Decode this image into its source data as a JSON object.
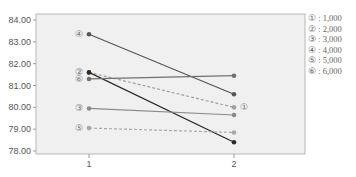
{
  "chart_data": {
    "type": "line",
    "title": "",
    "xlabel": "",
    "ylabel": "",
    "categories": [
      "1",
      "2"
    ],
    "ylim": [
      77.8,
      84.3
    ],
    "yticks": [
      "84.00",
      "83.00",
      "82.00",
      "81.00",
      "80.00",
      "79.00",
      "78.00"
    ],
    "ytick_values": [
      84,
      83,
      82,
      81,
      80,
      79,
      78
    ],
    "grid": false,
    "legend_position": "right",
    "series": [
      {
        "marker": "①",
        "name": "1,000",
        "values": [
          81.6,
          80.0
        ],
        "dashed": true,
        "color": "#a0a0a0",
        "label_side": "end"
      },
      {
        "marker": "②",
        "name": "2,000",
        "values": [
          81.6,
          78.4
        ],
        "dashed": false,
        "color": "#2a2a2a",
        "label_side": "start"
      },
      {
        "marker": "③",
        "name": "3,000",
        "values": [
          79.95,
          79.65
        ],
        "dashed": false,
        "color": "#8a8a8a",
        "label_side": "start"
      },
      {
        "marker": "④",
        "name": "4,000",
        "values": [
          83.35,
          80.6
        ],
        "dashed": false,
        "color": "#555555",
        "label_side": "start"
      },
      {
        "marker": "⑤",
        "name": "5,000",
        "values": [
          79.05,
          78.85
        ],
        "dashed": true,
        "color": "#a8a8a8",
        "label_side": "start"
      },
      {
        "marker": "⑥",
        "name": "6,000",
        "values": [
          81.3,
          81.45
        ],
        "dashed": false,
        "color": "#707070",
        "label_side": "start"
      }
    ]
  },
  "legend": {
    "items": [
      {
        "marker": "①",
        "text": "1,000"
      },
      {
        "marker": "②",
        "text": "2,000"
      },
      {
        "marker": "③",
        "text": "3,000"
      },
      {
        "marker": "④",
        "text": "4,000"
      },
      {
        "marker": "⑤",
        "text": "5,000"
      },
      {
        "marker": "⑥",
        "text": "6,000"
      }
    ]
  },
  "colors": {
    "plot_background": "#f0f0f0",
    "axis": "#999999",
    "tick_label": "#555555"
  }
}
